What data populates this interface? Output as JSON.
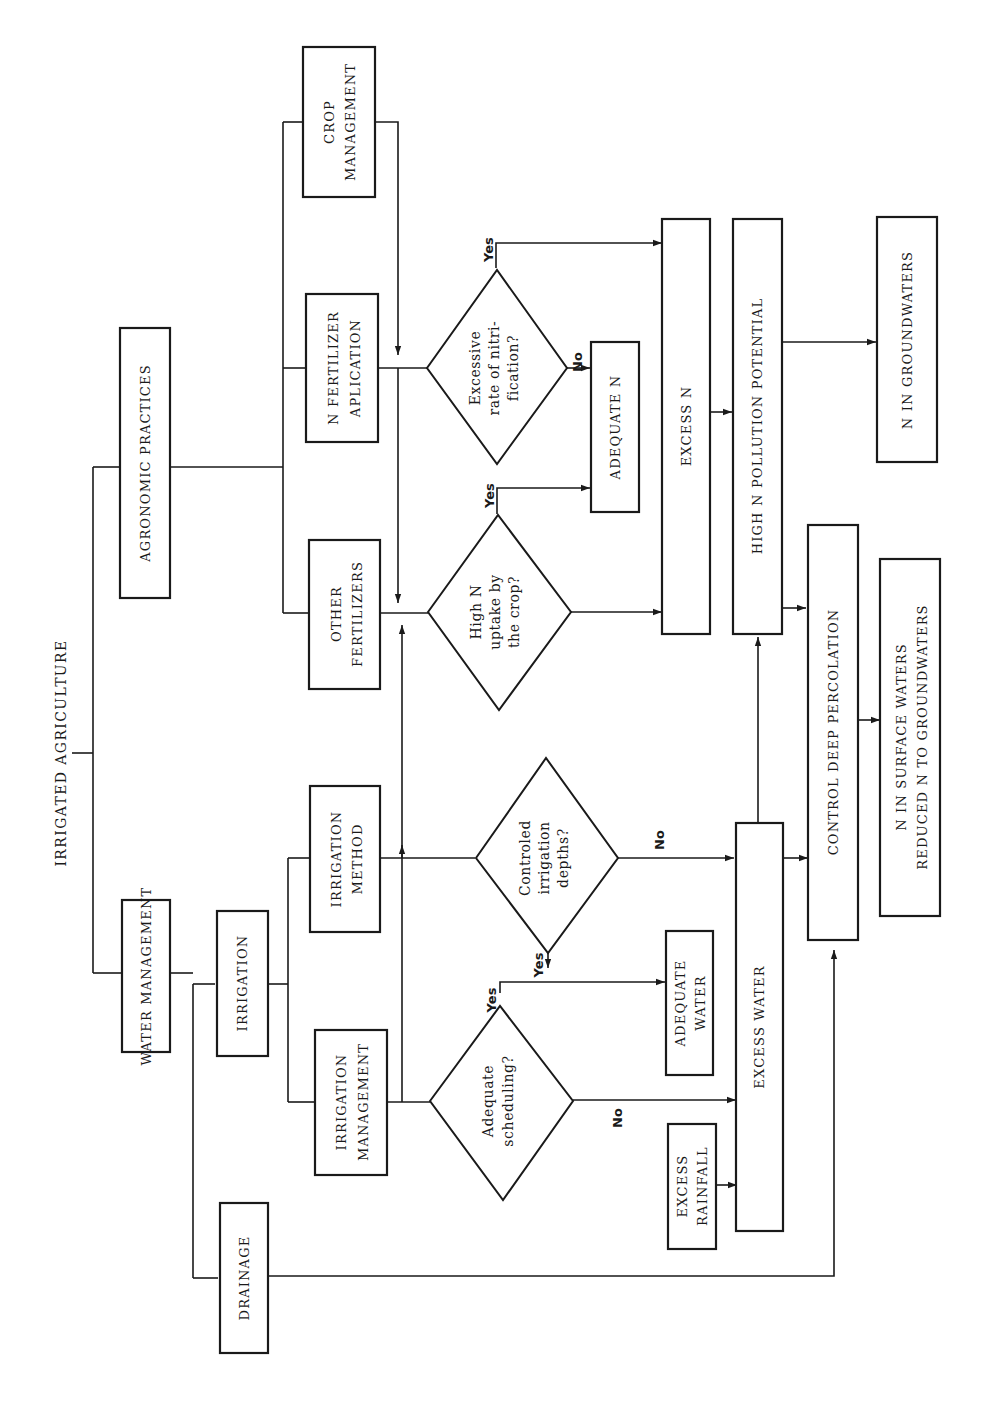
{
  "diagram": {
    "orientation": "rotated-90-ccw",
    "root": {
      "label": "IRRIGATED AGRICULTURE"
    },
    "branches": {
      "water_management": "WATER MANAGEMENT",
      "agronomic_practices": "AGRONOMIC PRACTICES",
      "irrigation": "IRRIGATION",
      "drainage": "DRAINAGE",
      "irrigation_management": [
        "IRRIGATION",
        "MANAGEMENT"
      ],
      "irrigation_method": [
        "IRRIGATION",
        "METHOD"
      ],
      "other_fertilizers": [
        "OTHER",
        "FERTILIZERS"
      ],
      "n_fertilizer": [
        "N FERTILIZER",
        "APLICATION"
      ],
      "crop_management": [
        "CROP",
        "MANAGEMENT"
      ]
    },
    "decisions": {
      "adequate_scheduling": [
        "Adequate",
        "scheduling?"
      ],
      "controled_depths": [
        "Controled",
        "irrigation",
        "depths?"
      ],
      "high_n_uptake": [
        "High N",
        "uptake by",
        "the crop?"
      ],
      "excessive_nitrification": [
        "Excessive",
        "rate of nitri-",
        "fication?"
      ]
    },
    "outcomes": {
      "excess_rainfall": [
        "EXCESS",
        "RAINFALL"
      ],
      "adequate_water": [
        "ADEQUATE",
        "WATER"
      ],
      "excess_water": "EXCESS WATER",
      "adequate_n": "ADEQUATE N",
      "excess_n": "EXCESS N",
      "high_n_pollution": "HIGH N POLLUTION POTENTIAL",
      "control_deep_percolation": "CONTROL DEEP PERCOLATION",
      "n_in_groundwaters": "N IN GROUNDWATERS",
      "n_in_surface_waters": [
        "N IN SURFACE WATERS",
        "REDUCED N TO GROUNDWATERS"
      ]
    },
    "edge_labels": {
      "yes": "Yes",
      "no": "No"
    }
  }
}
